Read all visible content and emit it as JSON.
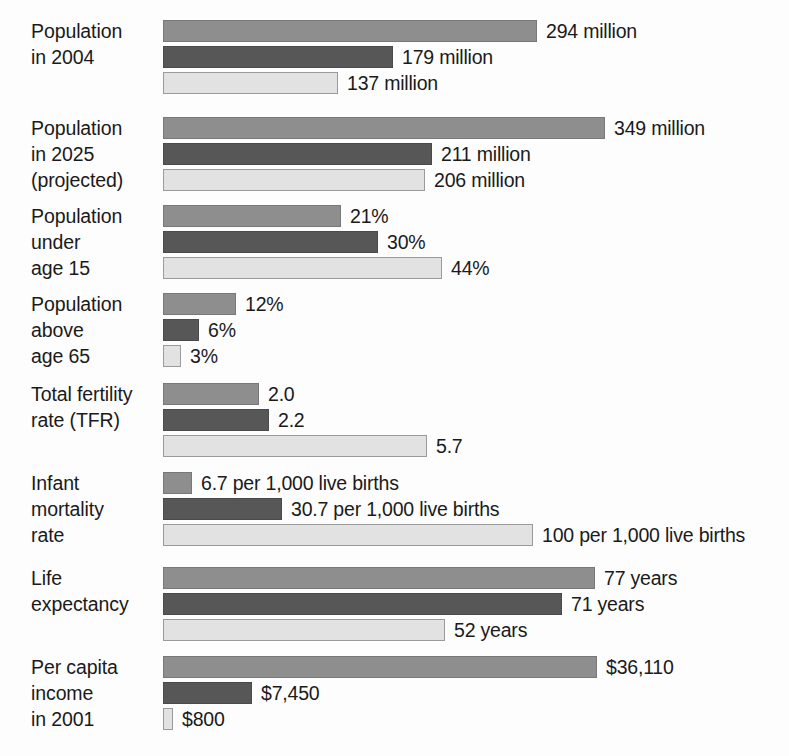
{
  "chart_data": {
    "type": "bar",
    "orientation": "horizontal",
    "title": "",
    "xlabel": "",
    "ylabel": "",
    "grid": false,
    "legend_position": "none",
    "series": [
      {
        "name": "series-1",
        "color": "#8e8e8e",
        "values": [
          294,
          349,
          21,
          12,
          2.0,
          6.7,
          77,
          36110
        ],
        "labels": [
          "294 million",
          "349 million",
          "21%",
          "12%",
          "2.0",
          "6.7 per 1,000 live births",
          "77 years",
          "$36,110"
        ]
      },
      {
        "name": "series-2",
        "color": "#575757",
        "values": [
          179,
          211,
          30,
          6,
          2.2,
          30.7,
          71,
          7450
        ],
        "labels": [
          "179 million",
          "211 million",
          "30%",
          "6%",
          "2.2",
          "30.7 per 1,000 live births",
          "71 years",
          "$7,450"
        ]
      },
      {
        "name": "series-3",
        "color": "#e2e2e2",
        "values": [
          137,
          206,
          44,
          3,
          5.7,
          100,
          52,
          800
        ],
        "labels": [
          "137 million",
          "206 million",
          "44%",
          "3%",
          "5.7",
          "100 per 1,000 live births",
          "52 years",
          "$800"
        ]
      }
    ],
    "categories": [
      "Population\nin 2004",
      "Population\nin 2025\n(projected)",
      "Population\nunder\nage 15",
      "Population\nabove\nage 65",
      "Total fertility\nrate (TFR)",
      "Infant\nmortality\nrate",
      "Life\nexpectancy",
      "Per capita\nincome\nin 2001"
    ]
  },
  "groups": [
    {
      "label": "Population\nin 2004",
      "top": 18,
      "bars": [
        {
          "value_label": "294 million",
          "width": 374,
          "series": 0
        },
        {
          "value_label": "179 million",
          "width": 230,
          "series": 1
        },
        {
          "value_label": "137 million",
          "width": 175,
          "series": 2
        }
      ]
    },
    {
      "label": "Population\nin 2025\n(projected)",
      "top": 115,
      "bars": [
        {
          "value_label": "349 million",
          "width": 442,
          "series": 0
        },
        {
          "value_label": "211 million",
          "width": 269,
          "series": 1
        },
        {
          "value_label": "206 million",
          "width": 262,
          "series": 2
        }
      ]
    },
    {
      "label": "Population\nunder\nage 15",
      "top": 203,
      "bars": [
        {
          "value_label": "21%",
          "width": 178,
          "series": 0
        },
        {
          "value_label": "30%",
          "width": 215,
          "series": 1
        },
        {
          "value_label": "44%",
          "width": 279,
          "series": 2
        }
      ]
    },
    {
      "label": "Population\nabove\nage 65",
      "top": 291,
      "bars": [
        {
          "value_label": "12%",
          "width": 73,
          "series": 0
        },
        {
          "value_label": "6%",
          "width": 36,
          "series": 1
        },
        {
          "value_label": "3%",
          "width": 18,
          "series": 2
        }
      ]
    },
    {
      "label": "Total fertility\nrate (TFR)",
      "top": 381,
      "bars": [
        {
          "value_label": "2.0",
          "width": 96,
          "series": 0
        },
        {
          "value_label": "2.2",
          "width": 106,
          "series": 1
        },
        {
          "value_label": "5.7",
          "width": 264,
          "series": 2
        }
      ]
    },
    {
      "label": "Infant\nmortality\nrate",
      "top": 470,
      "bars": [
        {
          "value_label": "6.7 per 1,000 live births",
          "width": 29,
          "series": 0
        },
        {
          "value_label": "30.7 per 1,000 live births",
          "width": 119,
          "series": 1
        },
        {
          "value_label": "100 per 1,000 live births",
          "width": 370,
          "series": 2
        }
      ]
    },
    {
      "label": "Life\nexpectancy",
      "top": 565,
      "bars": [
        {
          "value_label": "77 years",
          "width": 432,
          "series": 0
        },
        {
          "value_label": "71 years",
          "width": 399,
          "series": 1
        },
        {
          "value_label": "52 years",
          "width": 282,
          "series": 2
        }
      ]
    },
    {
      "label": "Per capita\nincome\nin 2001",
      "top": 654,
      "bars": [
        {
          "value_label": "$36,110",
          "width": 434,
          "series": 0
        },
        {
          "value_label": "$7,450",
          "width": 89,
          "series": 1
        },
        {
          "value_label": "$800",
          "width": 10,
          "series": 2
        }
      ]
    }
  ]
}
